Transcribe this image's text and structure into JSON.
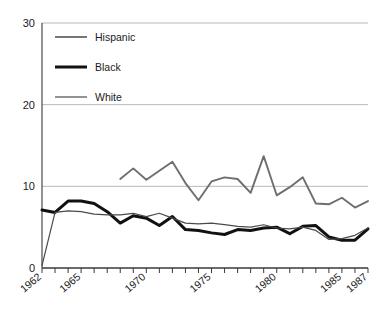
{
  "chart_data": {
    "type": "line",
    "title": "",
    "xlabel": "",
    "ylabel": "",
    "xlim": [
      1962,
      1987
    ],
    "ylim": [
      0,
      30
    ],
    "yticks": [
      0,
      10,
      20,
      30
    ],
    "ytick_labels": [
      "0",
      "10",
      "20",
      "30"
    ],
    "xtick_labels": [
      "1962",
      "1965",
      "1970",
      "1975",
      "1980",
      "1985",
      "1987"
    ],
    "xtick_values": [
      1962,
      1965,
      1970,
      1975,
      1980,
      1985,
      1987
    ],
    "x_all_ticks": [
      1962,
      1963,
      1964,
      1965,
      1966,
      1967,
      1968,
      1969,
      1970,
      1971,
      1972,
      1973,
      1974,
      1975,
      1976,
      1977,
      1978,
      1979,
      1980,
      1981,
      1982,
      1983,
      1984,
      1985,
      1986,
      1987
    ],
    "grid": "horizontal",
    "legend_position": "top-left-inside",
    "series": [
      {
        "name": "Hispanic",
        "color": "#6e6e6e",
        "width": 1.9,
        "x": [
          1968,
          1969,
          1970,
          1971,
          1972,
          1973,
          1974,
          1975,
          1976,
          1977,
          1978,
          1979,
          1980,
          1981,
          1982,
          1983,
          1984,
          1985,
          1986,
          1987
        ],
        "values": [
          10.9,
          12.2,
          10.8,
          11.9,
          13.0,
          10.4,
          8.3,
          10.6,
          11.1,
          10.9,
          9.2,
          13.7,
          8.9,
          9.9,
          11.1,
          7.9,
          7.8,
          8.6,
          7.4,
          8.2
        ]
      },
      {
        "name": "Black",
        "color": "#111111",
        "width": 3.0,
        "x": [
          1962,
          1963,
          1964,
          1965,
          1966,
          1967,
          1968,
          1969,
          1970,
          1971,
          1972,
          1973,
          1974,
          1975,
          1976,
          1977,
          1978,
          1979,
          1980,
          1981,
          1982,
          1983,
          1984,
          1985,
          1986,
          1987
        ],
        "values": [
          7.1,
          6.8,
          8.2,
          8.2,
          7.9,
          6.9,
          5.5,
          6.4,
          6.1,
          5.2,
          6.3,
          4.7,
          4.6,
          4.3,
          4.1,
          4.7,
          4.6,
          4.9,
          5.0,
          4.2,
          5.1,
          5.2,
          3.8,
          3.4,
          3.4,
          4.8
        ]
      },
      {
        "name": "White",
        "color": "#4a4a4a",
        "width": 1.2,
        "x": [
          1962,
          1963,
          1964,
          1965,
          1966,
          1967,
          1968,
          1969,
          1970,
          1971,
          1972,
          1973,
          1974,
          1975,
          1976,
          1977,
          1978,
          1979,
          1980,
          1981,
          1982,
          1983,
          1984,
          1985,
          1986,
          1987
        ],
        "values": [
          0.3,
          6.8,
          7.0,
          6.9,
          6.6,
          6.5,
          6.5,
          6.7,
          6.3,
          6.7,
          6.1,
          5.5,
          5.4,
          5.5,
          5.3,
          5.1,
          5.0,
          5.3,
          4.9,
          4.8,
          5.0,
          4.6,
          3.5,
          3.6,
          4.0,
          4.9
        ]
      }
    ],
    "legend": [
      {
        "label": "Hispanic",
        "color": "#6e6e6e",
        "width": 1.9
      },
      {
        "label": "Black",
        "color": "#111111",
        "width": 3.0
      },
      {
        "label": "White",
        "color": "#4a4a4a",
        "width": 1.2
      }
    ],
    "colors": {
      "axis": "#3a3a3a",
      "grid": "#b8b8b8",
      "background": "#ffffff",
      "text": "#1a1a1a"
    }
  }
}
